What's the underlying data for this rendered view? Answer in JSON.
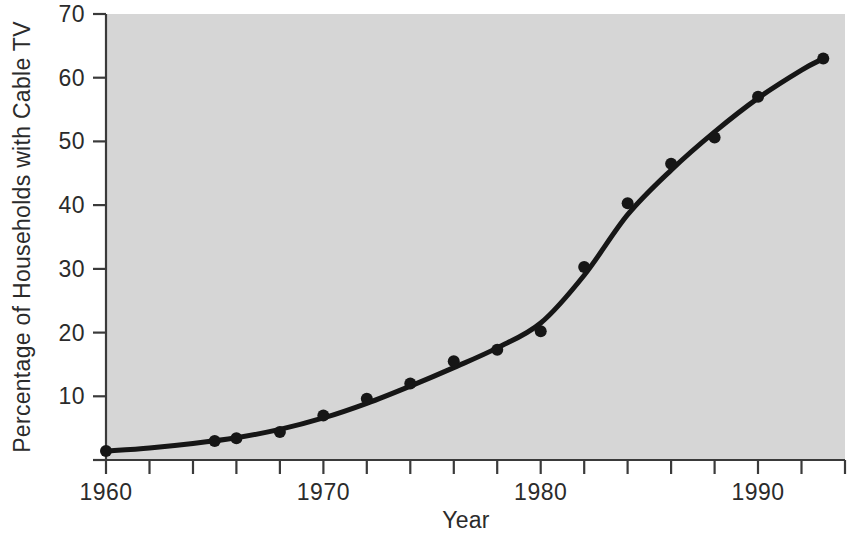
{
  "chart_data": {
    "type": "scatter",
    "title": "",
    "xlabel": "Year",
    "ylabel": "Percentage of Households with Cable TV",
    "xlim": [
      1960,
      1994
    ],
    "ylim": [
      0,
      70
    ],
    "grid": false,
    "legend": "none",
    "x_tick_labels": [
      "1960",
      "1970",
      "1980",
      "1990"
    ],
    "x_tick_values": [
      1960,
      1970,
      1980,
      1990
    ],
    "x_minor_tick_values": [
      1962,
      1964,
      1966,
      1968,
      1972,
      1974,
      1976,
      1978,
      1982,
      1984,
      1986,
      1988,
      1992,
      1994
    ],
    "y_tick_labels": [
      "10",
      "20",
      "30",
      "40",
      "50",
      "60",
      "70"
    ],
    "y_tick_values": [
      10,
      20,
      30,
      40,
      50,
      60,
      70
    ],
    "series": [
      {
        "name": "Percentage of Households with Cable TV",
        "marker": "filled-circle",
        "x": [
          1960,
          1965,
          1966,
          1968,
          1970,
          1972,
          1974,
          1976,
          1978,
          1980,
          1982,
          1984,
          1986,
          1988,
          1990,
          1993
        ],
        "values": [
          1.4,
          3.0,
          3.4,
          4.4,
          7.0,
          9.6,
          12.0,
          15.5,
          17.3,
          20.2,
          30.3,
          40.3,
          46.5,
          50.6,
          57.0,
          63.0
        ]
      }
    ],
    "fitted_curve": {
      "name": "smoothed logistic trend",
      "x": [
        1960,
        1962,
        1964,
        1966,
        1968,
        1970,
        1972,
        1974,
        1976,
        1978,
        1980,
        1982,
        1984,
        1986,
        1988,
        1990,
        1992,
        1993
      ],
      "values": [
        1.4,
        1.9,
        2.6,
        3.5,
        4.8,
        6.6,
        8.9,
        11.6,
        14.5,
        17.6,
        21.5,
        29.0,
        38.5,
        45.5,
        51.5,
        56.8,
        61.2,
        63.0
      ]
    }
  },
  "figure": {
    "background_color": "#ffffff",
    "plot_area_color": "#d6d6d6",
    "line_color": "#161616",
    "marker_color": "#161616",
    "axis_color": "#3a3a3a"
  }
}
